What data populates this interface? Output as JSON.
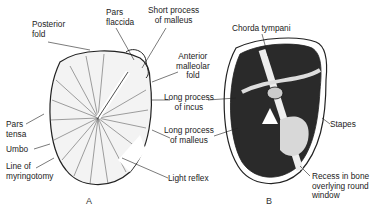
{
  "figure": {
    "panels": [
      {
        "id": "A",
        "label": "A"
      },
      {
        "id": "B",
        "label": "B"
      }
    ],
    "labels_A": {
      "posterior_fold": "Posterior\nfold",
      "pars_flaccida": "Pars\nflaccida",
      "short_process": "Short process\nof malleus",
      "anterior_fold": "Anterior\nmalleolar\nfold",
      "long_incus": "Long process\nof incus",
      "long_malleus": "Long process\nof malleus",
      "pars_tensa": "Pars\ntensa",
      "umbo": "Umbo",
      "myringotomy": "Line of\nmyringotomy",
      "light_reflex": "Light reflex"
    },
    "labels_B": {
      "chorda": "Chorda tympani",
      "stapes": "Stapes",
      "recess": "Recess in bone\noverlying round\nwindow"
    }
  }
}
